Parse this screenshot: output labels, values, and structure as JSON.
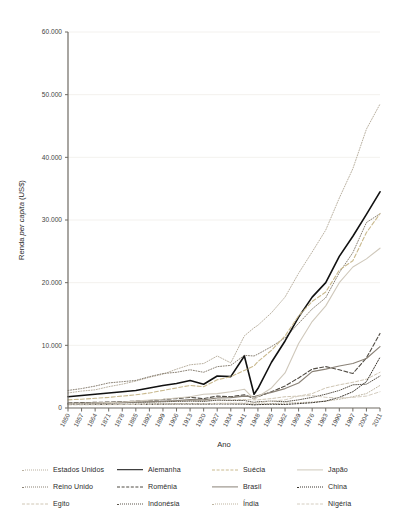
{
  "chart_data": {
    "type": "line",
    "title": "",
    "xlabel": "Ano",
    "ylabel_plain": "Renda ",
    "ylabel_italic": "per capita",
    "ylabel_suffix": " (US$)",
    "ylabel_full": "Renda per capita (US$)",
    "xlim": [
      1850,
      2011
    ],
    "ylim": [
      0,
      60000
    ],
    "grid": true,
    "legend_position": "bottom",
    "ytick_labels": [
      "0",
      "10.000",
      "20.000",
      "30.000",
      "40.000",
      "50.000",
      "60.000"
    ],
    "ytick_values": [
      0,
      10000,
      20000,
      30000,
      40000,
      50000,
      60000
    ],
    "xtick_labels": [
      "1850",
      "1857",
      "1864",
      "1871",
      "1878",
      "1885",
      "1892",
      "1899",
      "1906",
      "1913",
      "1920",
      "1927",
      "1934",
      "1941",
      "1948",
      "1955",
      "1962",
      "1969",
      "1976",
      "1983",
      "1990",
      "1997",
      "2004",
      "2011"
    ],
    "xtick_values": [
      1850,
      1857,
      1864,
      1871,
      1878,
      1885,
      1892,
      1899,
      1906,
      1913,
      1920,
      1927,
      1934,
      1941,
      1948,
      1955,
      1962,
      1969,
      1976,
      1983,
      1990,
      1997,
      2004,
      2011
    ],
    "x": [
      1850,
      1857,
      1864,
      1871,
      1878,
      1885,
      1892,
      1899,
      1906,
      1913,
      1920,
      1927,
      1934,
      1941,
      1946,
      1948,
      1955,
      1962,
      1969,
      1976,
      1983,
      1990,
      1997,
      2004,
      2011
    ],
    "series": [
      {
        "name": "Estados Unidos",
        "style": "dotted",
        "color": "#b9b0a0",
        "width": 1.0,
        "values": [
          2400,
          2700,
          2900,
          3400,
          3800,
          4300,
          4900,
          5400,
          6200,
          6900,
          7100,
          8300,
          7200,
          11500,
          12800,
          13200,
          15200,
          17700,
          21500,
          24900,
          28400,
          33500,
          38200,
          44500,
          48500
        ]
      },
      {
        "name": "Reino Unido",
        "style": "dotted",
        "color": "#8b8275",
        "width": 1.0,
        "values": [
          2800,
          3100,
          3500,
          4000,
          4200,
          4400,
          5000,
          5500,
          5700,
          6100,
          5700,
          6600,
          6800,
          8400,
          8300,
          8600,
          9800,
          11200,
          13500,
          15800,
          17600,
          21600,
          24800,
          29600,
          31000
        ]
      },
      {
        "name": "Egito",
        "style": "dashed-fine",
        "color": "#cfc6b4",
        "width": 1.0,
        "values": [
          700,
          720,
          760,
          800,
          850,
          900,
          950,
          1000,
          1100,
          1150,
          1150,
          1300,
          1300,
          1350,
          1300,
          1300,
          1500,
          1800,
          1900,
          2300,
          3200,
          3700,
          4100,
          4600,
          5700
        ]
      },
      {
        "name": "Alemanha",
        "style": "solid",
        "color": "#111111",
        "width": 1.6,
        "values": [
          1800,
          2000,
          2200,
          2400,
          2600,
          2800,
          3200,
          3600,
          3900,
          4400,
          3800,
          5100,
          5000,
          8300,
          2200,
          3100,
          7300,
          10700,
          14500,
          17700,
          20000,
          24200,
          27400,
          30900,
          34500
        ]
      },
      {
        "name": "Romênia",
        "style": "dashed",
        "color": "#4f4a42",
        "width": 1.1,
        "values": [
          800,
          850,
          900,
          950,
          1000,
          1100,
          1200,
          1350,
          1500,
          1700,
          1500,
          1900,
          1800,
          2100,
          1500,
          1800,
          2600,
          3500,
          4800,
          6200,
          6600,
          6100,
          5500,
          8000,
          11900
        ]
      },
      {
        "name": "Indonésia",
        "style": "dotted-fine",
        "color": "#5c564c",
        "width": 1.0,
        "values": [
          700,
          730,
          760,
          800,
          850,
          900,
          950,
          1000,
          1050,
          1100,
          1050,
          1250,
          1200,
          1200,
          900,
          1000,
          1100,
          1000,
          1300,
          1700,
          2200,
          2800,
          3700,
          3800,
          5100
        ]
      },
      {
        "name": "Suécia",
        "style": "dashed-light",
        "color": "#c9b98e",
        "width": 1.1,
        "values": [
          1300,
          1400,
          1550,
          1700,
          1900,
          2100,
          2400,
          2800,
          3200,
          3600,
          3400,
          4500,
          5000,
          6000,
          6700,
          7400,
          9200,
          11500,
          14700,
          17000,
          18500,
          22000,
          23500,
          28000,
          31000
        ]
      },
      {
        "name": "Brasil",
        "style": "solid-gray",
        "color": "#8a8277",
        "width": 1.2,
        "values": [
          750,
          780,
          820,
          850,
          900,
          950,
          1000,
          1100,
          1200,
          1350,
          1300,
          1600,
          1650,
          1900,
          1800,
          2000,
          2500,
          3100,
          4000,
          5800,
          6200,
          6700,
          7100,
          7900,
          9800
        ]
      },
      {
        "name": "Índia",
        "style": "dotted-light",
        "color": "#bdb49f",
        "width": 1.0,
        "values": [
          550,
          560,
          580,
          600,
          620,
          640,
          660,
          680,
          700,
          720,
          680,
          750,
          740,
          720,
          620,
          650,
          700,
          780,
          850,
          950,
          1100,
          1400,
          1800,
          2300,
          3600
        ]
      },
      {
        "name": "Japão",
        "style": "solid-light",
        "color": "#cfc8bb",
        "width": 1.1,
        "values": [
          700,
          720,
          780,
          850,
          950,
          1100,
          1250,
          1400,
          1600,
          1800,
          2200,
          2300,
          2600,
          3000,
          1400,
          1800,
          3200,
          5600,
          10300,
          13800,
          16300,
          20000,
          22500,
          23800,
          25500
        ]
      },
      {
        "name": "China",
        "style": "dotted-dark",
        "color": "#3a352e",
        "width": 1.0,
        "values": [
          600,
          600,
          590,
          580,
          580,
          580,
          590,
          600,
          620,
          630,
          620,
          650,
          640,
          620,
          500,
          540,
          600,
          560,
          700,
          850,
          1100,
          1700,
          2600,
          4200,
          8100
        ]
      },
      {
        "name": "Nigéria",
        "style": "dashed-pale",
        "color": "#d4cdc0",
        "width": 1.0,
        "values": [
          500,
          510,
          520,
          530,
          550,
          570,
          590,
          620,
          650,
          680,
          680,
          720,
          750,
          780,
          800,
          850,
          1100,
          1300,
          1900,
          2000,
          1700,
          1600,
          1700,
          1900,
          2600
        ]
      }
    ],
    "series_peaks_note": {
      "Japao_peak": 53000,
      "Alemanha_peak": 44500,
      "Estados_Unidos_peak": 48500,
      "Suecia_peak": 42000,
      "Reino_Unido_peak": 37500,
      "Romenia_peak": 19000,
      "Brasil_peak": 14500,
      "China_peak": 12000
    }
  },
  "legend": {
    "items": [
      {
        "label": "Estados Unidos",
        "style": "dotted",
        "color": "#b9b0a0"
      },
      {
        "label": "Alemanha",
        "style": "solid",
        "color": "#111111"
      },
      {
        "label": "Suécia",
        "style": "dashed-light",
        "color": "#c9b98e"
      },
      {
        "label": "Japão",
        "style": "solid-light",
        "color": "#cfc8bb"
      },
      {
        "label": "Reino Unido",
        "style": "dotted",
        "color": "#8b8275"
      },
      {
        "label": "Romênia",
        "style": "dashed",
        "color": "#4f4a42"
      },
      {
        "label": "Brasil",
        "style": "solid-gray",
        "color": "#8a8277"
      },
      {
        "label": "China",
        "style": "dotted-dark",
        "color": "#3a352e"
      },
      {
        "label": "Egito",
        "style": "dashed-fine",
        "color": "#cfc6b4"
      },
      {
        "label": "Indonésia",
        "style": "dotted-fine",
        "color": "#5c564c"
      },
      {
        "label": "Índia",
        "style": "dotted-light",
        "color": "#bdb49f"
      },
      {
        "label": "Nigéria",
        "style": "dashed-pale",
        "color": "#d4cdc0"
      }
    ]
  },
  "colors": {
    "background": "#ffffff",
    "axis": "#6e6a63",
    "grid": "#f0eeea",
    "text": "#2b2b2b"
  }
}
